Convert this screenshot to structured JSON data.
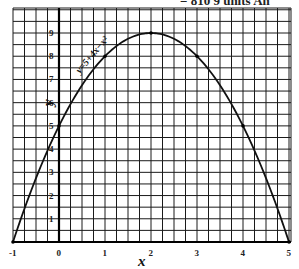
{
  "header": {
    "cut_text": "= 810 9 units   An"
  },
  "chart_data": {
    "type": "line",
    "title": "",
    "equation": "y = 5 + 4x − x²",
    "xlabel": "x",
    "ylabel": "y",
    "x": [
      -1,
      0,
      1,
      2,
      3,
      4,
      5
    ],
    "series": [
      {
        "name": "y = 5 + 4x − x²",
        "values": [
          0,
          5,
          8,
          9,
          8,
          5,
          0
        ]
      }
    ],
    "xlim": [
      -1,
      5
    ],
    "ylim": [
      0,
      10
    ],
    "x_ticks": [
      "-1",
      "0",
      "1",
      "2",
      "3",
      "4",
      "5"
    ],
    "y_ticks": [
      "1",
      "2",
      "3",
      "4",
      "5",
      "6",
      "7",
      "8",
      "9"
    ],
    "grid": true,
    "legend": "none",
    "colors": {
      "grid": "#1a1a1a",
      "curve": "#111111",
      "background": "#ffffff"
    }
  },
  "labels": {
    "x_axis": "x",
    "y_axis": "y",
    "equation": "y=5+4x−x²"
  }
}
